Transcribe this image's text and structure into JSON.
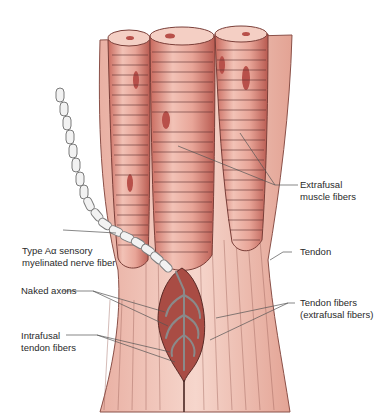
{
  "figure": {
    "colors": {
      "background": "#ffffff",
      "muscle_fill": "#e8a598",
      "muscle_dark": "#c96a5e",
      "muscle_light": "#f6d6cc",
      "tendon_fill": "#f1c3b6",
      "nerve_fill": "#f2f2f2",
      "nerve_outline": "#7a7a7a",
      "capsule_fill": "#a94c44",
      "line_color": "#555555"
    }
  },
  "labels": {
    "extrafusal_muscle": "Extrafusal\nmuscle fibers",
    "nerve_fiber": "Type Aα sensory\nmyelinated nerve fiber",
    "tendon": "Tendon",
    "naked_axons": "Naked axons",
    "tendon_fibers": "Tendon fibers\n(extrafusal fibers)",
    "intrafusal": "Intrafusal\ntendon fibers"
  }
}
